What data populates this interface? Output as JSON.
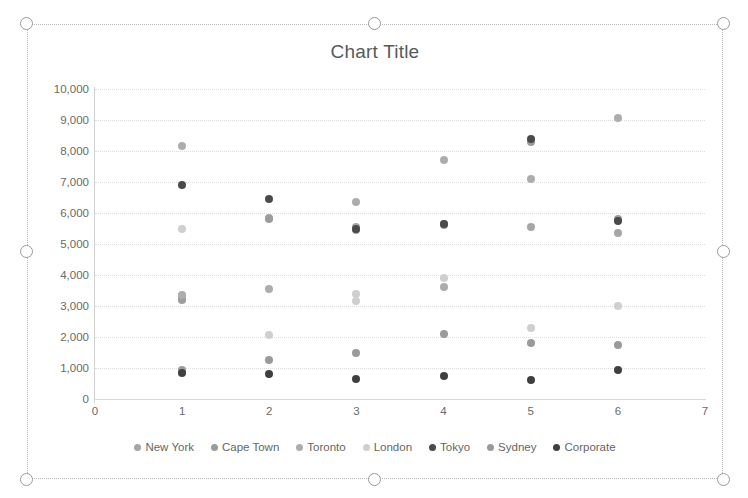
{
  "app": {
    "top_artifact_text": "                                                                                              "
  },
  "chart": {
    "title": "Chart Title",
    "selection_handles": [
      "top-left",
      "top-middle",
      "top-right",
      "middle-left",
      "middle-right",
      "bottom-left",
      "bottom-middle",
      "bottom-right"
    ]
  },
  "legend": {
    "position": "bottom",
    "items": [
      {
        "label": "New York",
        "color": "#a6a6a6"
      },
      {
        "label": "Cape Town",
        "color": "#9c9c9c"
      },
      {
        "label": "Toronto",
        "color": "#adadad"
      },
      {
        "label": "London",
        "color": "#cfcfcf"
      },
      {
        "label": "Tokyo",
        "color": "#4a4a4a"
      },
      {
        "label": "Sydney",
        "color": "#9a9a9a"
      },
      {
        "label": "Corporate",
        "color": "#3f3f3f"
      }
    ]
  },
  "axes": {
    "y_ticks": [
      "10,000",
      "9,000",
      "8,000",
      "7,000",
      "6,000",
      "5,000",
      "4,000",
      "3,000",
      "2,000",
      "1,000",
      "0"
    ],
    "x_ticks": [
      "0",
      "1",
      "2",
      "3",
      "4",
      "5",
      "6",
      "7"
    ]
  },
  "chart_data": {
    "type": "scatter",
    "title": "Chart Title",
    "xlabel": "",
    "ylabel": "",
    "xlim": [
      0,
      7
    ],
    "ylim": [
      0,
      10000
    ],
    "ytick_step": 1000,
    "xtick_step": 1,
    "grid": true,
    "legend_position": "bottom",
    "x": [
      1,
      2,
      3,
      4,
      5,
      6
    ],
    "series": [
      {
        "name": "New York",
        "color": "#a6a6a6",
        "values": [
          3300,
          5850,
          5550,
          5650,
          5550,
          5350
        ]
      },
      {
        "name": "Cape Town",
        "color": "#9c9c9c",
        "values": [
          3200,
          5800,
          5450,
          5600,
          8300,
          5800
        ]
      },
      {
        "name": "Toronto",
        "color": "#adadad",
        "values": [
          8150,
          3550,
          6350,
          7700,
          7100,
          9050
        ]
      },
      {
        "name": "London",
        "color": "#cfcfcf",
        "values": [
          5500,
          2050,
          3400,
          3900,
          2300,
          3000
        ]
      },
      {
        "name": "Tokyo",
        "color": "#4a4a4a",
        "values": [
          6900,
          6450,
          5500,
          5650,
          8400,
          5750
        ]
      },
      {
        "name": "Sydney",
        "color": "#9a9a9a",
        "values": [
          950,
          1250,
          1500,
          2100,
          1800,
          1750
        ]
      },
      {
        "name": "Corporate",
        "color": "#3f3f3f",
        "values": [
          850,
          800,
          650,
          750,
          600,
          950
        ]
      }
    ],
    "extra_points": [
      {
        "series": "Toronto",
        "x": 1,
        "y": 3350
      },
      {
        "series": "London",
        "x": 3,
        "y": 3150
      },
      {
        "series": "Toronto",
        "x": 4,
        "y": 3600
      }
    ]
  }
}
